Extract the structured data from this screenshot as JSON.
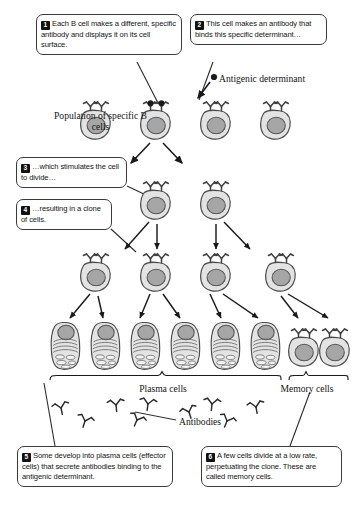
{
  "figure": {
    "callouts": [
      {
        "num": "1",
        "text": "Each B cell makes a different, specific antibody and displays it on its cell surface."
      },
      {
        "num": "2",
        "text": "This cell makes an antibody that binds this specific determinant…"
      },
      {
        "num": "3",
        "text": "…which stimulates the cell to divide…"
      },
      {
        "num": "4",
        "text": "…resulting in a clone of cells."
      },
      {
        "num": "5",
        "text": "Some develop into plasma cells (effector cells) that secrete antibodies binding to the antigenic determinant."
      },
      {
        "num": "6",
        "text": "A few cells divide at a low rate, perpetuating the clone. These are called memory cells."
      }
    ],
    "labels": {
      "population": "Population of specific B cells",
      "antigenic_determinant": "Antigenic determinant",
      "plasma_cells": "Plasma cells",
      "memory_cells": "Memory cells",
      "antibodies": "Antibodies"
    },
    "colors": {
      "cell_body": "#e3e3e3",
      "cell_outline": "#4a4a4a",
      "nucleus": "#a6a6a6",
      "nucleus_outline": "#555555",
      "ink": "#1a1a1a",
      "background": "#ffffff",
      "callout_border": "#3a3a3a",
      "badge_background": "#111111",
      "badge_text": "#ffffff"
    },
    "rows": {
      "population_row": {
        "count": 4,
        "type": "b-cell",
        "y": 125,
        "x_positions": [
          96,
          156,
          216,
          276
        ]
      },
      "selected_cell_index": 1,
      "division_row_2": {
        "count": 2,
        "type": "b-cell",
        "y": 205,
        "x_positions": [
          156,
          216
        ]
      },
      "division_row_3": {
        "count": 4,
        "type": "b-cell",
        "y": 277,
        "x_positions": [
          96,
          156,
          216,
          281
        ]
      },
      "final_row": {
        "count": 8,
        "y": 345,
        "x_positions": [
          66,
          106,
          146,
          186,
          226,
          266,
          300,
          332
        ],
        "types": [
          "plasma",
          "plasma",
          "plasma",
          "plasma",
          "plasma",
          "plasma",
          "memory",
          "memory"
        ]
      },
      "free_antibodies": {
        "count": 9
      }
    }
  }
}
